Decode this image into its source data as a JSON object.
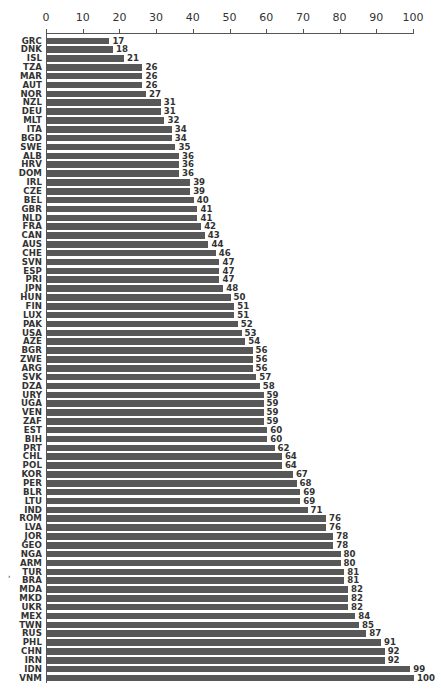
{
  "chart_data": {
    "type": "bar",
    "orientation": "horizontal",
    "title": "",
    "xlabel": "",
    "ylabel": "",
    "xlim": [
      0,
      100
    ],
    "x_ticks": [
      0,
      10,
      20,
      30,
      40,
      50,
      60,
      70,
      80,
      90,
      100
    ],
    "x_axis_position": "top",
    "grid": false,
    "legend": null,
    "data_labels": true,
    "bar_color": "#585858",
    "categories": [
      "GRC",
      "DNK",
      "ISL",
      "TZA",
      "MAR",
      "AUT",
      "NOR",
      "NZL",
      "DEU",
      "MLT",
      "ITA",
      "BGD",
      "SWE",
      "ALB",
      "HRV",
      "DOM",
      "IRL",
      "CZE",
      "BEL",
      "GBR",
      "NLD",
      "FRA",
      "CAN",
      "AUS",
      "CHE",
      "SVN",
      "ESP",
      "PRI",
      "JPN",
      "HUN",
      "FIN",
      "LUX",
      "PAK",
      "USA",
      "AZE",
      "BGR",
      "ZWE",
      "ARG",
      "SVK",
      "DZA",
      "URY",
      "UGA",
      "VEN",
      "ZAF",
      "EST",
      "BIH",
      "PRT",
      "CHL",
      "POL",
      "KOR",
      "PER",
      "BLR",
      "LTU",
      "IND",
      "ROM",
      "LVA",
      "JOR",
      "GEO",
      "NGA",
      "ARM",
      "TUR",
      "BRA",
      "MDA",
      "MKD",
      "UKR",
      "MEX",
      "TWN",
      "RUS",
      "PHL",
      "CHN",
      "IRN",
      "IDN",
      "VNM"
    ],
    "values": [
      17,
      18,
      21,
      26,
      26,
      26,
      27,
      31,
      31,
      32,
      34,
      34,
      35,
      36,
      36,
      36,
      39,
      39,
      40,
      41,
      41,
      42,
      43,
      44,
      46,
      47,
      47,
      47,
      48,
      50,
      51,
      51,
      52,
      53,
      54,
      56,
      56,
      56,
      57,
      58,
      59,
      59,
      59,
      59,
      60,
      60,
      62,
      64,
      64,
      67,
      68,
      69,
      69,
      71,
      76,
      76,
      78,
      78,
      80,
      80,
      81,
      81,
      82,
      82,
      82,
      84,
      85,
      87,
      91,
      92,
      92,
      99,
      100
    ]
  },
  "annotations": {
    "stray_mark": ","
  }
}
